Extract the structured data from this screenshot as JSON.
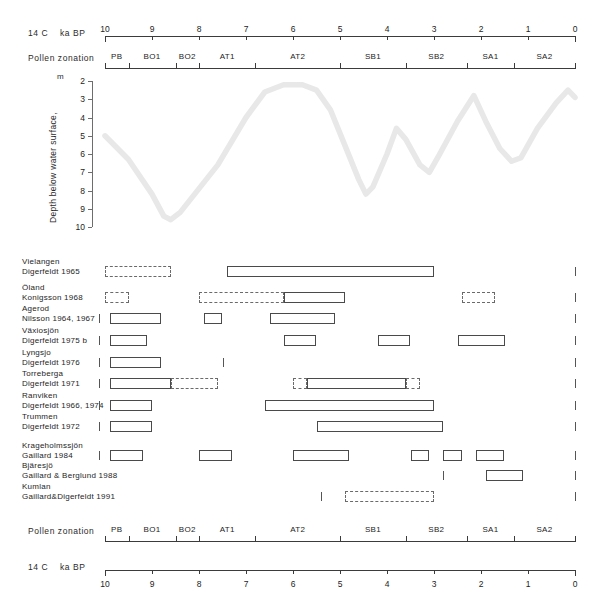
{
  "figure": {
    "title": "",
    "axis_top": {
      "caption_left": "14 C",
      "caption_right": "ka BP",
      "ticks": [
        10,
        9,
        8,
        7,
        6,
        5,
        4,
        3,
        2,
        1,
        0
      ],
      "x_start_value": 10,
      "x_end_value": 0
    },
    "axis_bottom": {
      "caption_left": "14 C",
      "caption_right": "ka BP",
      "ticks": [
        10,
        9,
        8,
        7,
        6,
        5,
        4,
        3,
        2,
        1,
        0
      ]
    },
    "pollen_zonation": {
      "caption": "Pollen zonation",
      "zones": [
        {
          "label": "PB",
          "start": 10.0,
          "end": 9.5
        },
        {
          "label": "BO1",
          "start": 9.5,
          "end": 8.5
        },
        {
          "label": "BO2",
          "start": 8.5,
          "end": 8.0
        },
        {
          "label": "AT1",
          "start": 8.0,
          "end": 6.8
        },
        {
          "label": "AT2",
          "start": 6.8,
          "end": 5.0
        },
        {
          "label": "SB1",
          "start": 5.0,
          "end": 3.6
        },
        {
          "label": "SB2",
          "start": 3.6,
          "end": 2.3
        },
        {
          "label": "SA1",
          "start": 2.3,
          "end": 1.3
        },
        {
          "label": "SA2",
          "start": 1.3,
          "end": 0.0
        }
      ]
    },
    "depth_axis": {
      "title": "Depth below water surface,",
      "unit": "m",
      "ticks": [
        2,
        3,
        4,
        5,
        6,
        7,
        8,
        9,
        10
      ],
      "min": 2,
      "max": 10
    }
  },
  "chart_data": {
    "type": "line",
    "title": "",
    "xlabel": "14 C ka BP",
    "ylabel": "Depth below water surface, m",
    "xlim": [
      10,
      0
    ],
    "ylim": [
      10,
      2
    ],
    "y_inverted": true,
    "grid": false,
    "legend": "none",
    "series": [
      {
        "name": "lake-level curve",
        "color": "#e8e8e8",
        "points": [
          [
            10.0,
            5.0
          ],
          [
            9.5,
            6.3
          ],
          [
            9.0,
            8.2
          ],
          [
            8.75,
            9.4
          ],
          [
            8.6,
            9.6
          ],
          [
            8.4,
            9.2
          ],
          [
            7.6,
            6.6
          ],
          [
            7.0,
            4.0
          ],
          [
            6.6,
            2.6
          ],
          [
            6.2,
            2.2
          ],
          [
            5.8,
            2.2
          ],
          [
            5.5,
            2.5
          ],
          [
            5.2,
            3.6
          ],
          [
            4.9,
            5.5
          ],
          [
            4.6,
            7.4
          ],
          [
            4.45,
            8.2
          ],
          [
            4.3,
            7.8
          ],
          [
            4.0,
            6.0
          ],
          [
            3.8,
            4.6
          ],
          [
            3.6,
            5.2
          ],
          [
            3.3,
            6.6
          ],
          [
            3.1,
            7.0
          ],
          [
            2.9,
            6.1
          ],
          [
            2.5,
            4.2
          ],
          [
            2.15,
            2.8
          ],
          [
            1.9,
            4.2
          ],
          [
            1.6,
            5.7
          ],
          [
            1.35,
            6.4
          ],
          [
            1.15,
            6.2
          ],
          [
            0.8,
            4.6
          ],
          [
            0.4,
            3.2
          ],
          [
            0.15,
            2.5
          ],
          [
            0.0,
            2.9
          ]
        ]
      }
    ],
    "zone_boundaries": [
      9.5,
      8.5,
      8.0,
      6.8,
      5.0,
      3.6,
      2.3,
      1.3
    ],
    "zone_labels": [
      "PB",
      "BO1",
      "BO2",
      "AT1",
      "AT2",
      "SB1",
      "SB2",
      "SA1",
      "SA2"
    ]
  },
  "sites": [
    {
      "name": "Vielangen",
      "reference": "Digerfeldt 1965",
      "bars": [
        {
          "start": 10.0,
          "end": 8.6,
          "style": "dashed"
        },
        {
          "start": 7.4,
          "end": 3.0,
          "style": "solid"
        }
      ],
      "end_tick": true
    },
    {
      "name": "Öland",
      "reference": "Konigsson 1968",
      "bars": [
        {
          "start": 10.0,
          "end": 9.5,
          "style": "dashed"
        },
        {
          "start": 8.0,
          "end": 6.2,
          "style": "dashed"
        },
        {
          "start": 6.2,
          "end": 4.9,
          "style": "solid"
        },
        {
          "start": 2.4,
          "end": 1.7,
          "style": "dashed"
        }
      ],
      "end_tick": true
    },
    {
      "name": "Agerod",
      "reference": "Nilsson 1964, 1967",
      "bars": [
        {
          "start": 9.9,
          "end": 8.8,
          "style": "solid"
        },
        {
          "start": 7.9,
          "end": 7.5,
          "style": "solid"
        },
        {
          "start": 6.5,
          "end": 5.1,
          "style": "solid"
        }
      ],
      "start_tick": true,
      "end_tick": true
    },
    {
      "name": "Växiosjön",
      "reference": "Digerfeldt 1975 b",
      "bars": [
        {
          "start": 9.9,
          "end": 9.1,
          "style": "solid"
        },
        {
          "start": 6.2,
          "end": 5.5,
          "style": "solid"
        },
        {
          "start": 4.2,
          "end": 3.5,
          "style": "solid"
        },
        {
          "start": 2.5,
          "end": 1.5,
          "style": "solid"
        }
      ],
      "start_tick": true,
      "end_tick": true
    },
    {
      "name": "Lyngsjo",
      "reference": "Digerfeldt 1976",
      "bars": [
        {
          "start": 9.9,
          "end": 8.8,
          "style": "solid"
        }
      ],
      "start_tick": true,
      "mid_tick": 7.5,
      "end_tick": true
    },
    {
      "name": "Torreberga",
      "reference": "Digerfeldt 1971",
      "bars": [
        {
          "start": 9.9,
          "end": 8.6,
          "style": "solid"
        },
        {
          "start": 8.6,
          "end": 7.6,
          "style": "dashed"
        },
        {
          "start": 6.0,
          "end": 5.7,
          "style": "dashed"
        },
        {
          "start": 5.7,
          "end": 3.6,
          "style": "solid"
        },
        {
          "start": 3.6,
          "end": 3.3,
          "style": "dashed"
        }
      ],
      "start_tick": true,
      "end_tick": true
    },
    {
      "name": "Ranviken",
      "reference": "Digerfeldt 1966, 1974",
      "bars": [
        {
          "start": 9.9,
          "end": 9.0,
          "style": "solid"
        },
        {
          "start": 6.6,
          "end": 3.0,
          "style": "solid"
        }
      ],
      "start_tick": true,
      "end_tick": true
    },
    {
      "name": "Trummen",
      "reference": "Digerfeldt 1972",
      "bars": [
        {
          "start": 9.9,
          "end": 9.0,
          "style": "solid"
        },
        {
          "start": 5.5,
          "end": 2.8,
          "style": "solid"
        }
      ],
      "start_tick": true,
      "end_tick": true
    },
    {
      "name": "Krageholmssjön",
      "reference": "Gaillard 1984",
      "bars": [
        {
          "start": 9.9,
          "end": 9.2,
          "style": "solid"
        },
        {
          "start": 8.0,
          "end": 7.3,
          "style": "solid"
        },
        {
          "start": 6.0,
          "end": 4.8,
          "style": "solid"
        },
        {
          "start": 3.5,
          "end": 3.1,
          "style": "solid"
        },
        {
          "start": 2.8,
          "end": 2.4,
          "style": "solid"
        },
        {
          "start": 2.1,
          "end": 1.5,
          "style": "solid"
        }
      ],
      "start_tick": true,
      "end_tick": true
    },
    {
      "name": "Bjäresjö",
      "reference": "Gaillard & Berglund 1988",
      "bars": [
        {
          "start": 1.9,
          "end": 1.1,
          "style": "solid"
        }
      ],
      "mid_tick": 2.8,
      "end_tick": true
    },
    {
      "name": "Kumlan",
      "reference": "Gaillard&Digerfeldt 1991",
      "bars": [
        {
          "start": 4.9,
          "end": 3.0,
          "style": "dashed"
        }
      ],
      "mid_tick": 5.4,
      "end_tick": true
    }
  ]
}
